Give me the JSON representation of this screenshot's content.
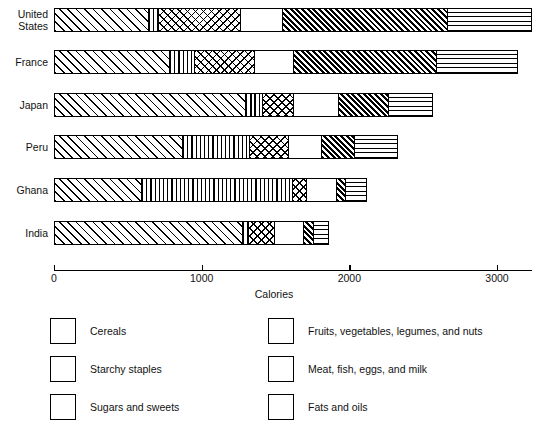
{
  "chart_data": {
    "type": "bar",
    "orientation": "horizontal",
    "stacked": true,
    "title": "",
    "xlabel": "Calories",
    "ylabel": "",
    "xlim": [
      0,
      3300
    ],
    "xticks": [
      0,
      1000,
      2000,
      3000
    ],
    "xtick_labels": [
      "0",
      "1000",
      "2000",
      "3000"
    ],
    "grid": false,
    "legend_position": "bottom",
    "categories": [
      "United States",
      "France",
      "Japan",
      "Peru",
      "Ghana",
      "India"
    ],
    "series": [
      {
        "name": "Cereals",
        "values": [
          640,
          780,
          1300,
          875,
          590,
          1285
        ]
      },
      {
        "name": "Starchy staples",
        "values": [
          70,
          175,
          115,
          455,
          1030,
          40
        ]
      },
      {
        "name": "Sugars and sweets",
        "values": [
          555,
          405,
          215,
          265,
          95,
          175
        ]
      },
      {
        "name": "Fruits, vegetables, legumes, and nuts",
        "values": [
          285,
          265,
          305,
          225,
          210,
          195
        ]
      },
      {
        "name": "Meat, fish, eggs, and milk",
        "values": [
          1125,
          970,
          340,
          225,
          60,
          75
        ]
      },
      {
        "name": "Fats and oils",
        "values": [
          565,
          550,
          290,
          285,
          135,
          95
        ]
      }
    ],
    "totals": [
      3240,
      3145,
      2565,
      2330,
      2120,
      1865
    ]
  },
  "axis": {
    "title": "Calories",
    "ticks": [
      "0",
      "1000",
      "2000",
      "3000"
    ]
  },
  "categories": [
    {
      "label": "United\nStates"
    },
    {
      "label": "France"
    },
    {
      "label": "Japan"
    },
    {
      "label": "Peru"
    },
    {
      "label": "Ghana"
    },
    {
      "label": "India"
    }
  ],
  "legend": {
    "items": [
      {
        "label": "Cereals",
        "pattern": "diagonal-hatch-sparse"
      },
      {
        "label": "Starchy staples",
        "pattern": "vertical-lines"
      },
      {
        "label": "Sugars and sweets",
        "pattern": "cross-hatch"
      },
      {
        "label": "Fruits, vegetables, legumes, and nuts",
        "pattern": "blank"
      },
      {
        "label": "Meat, fish, eggs, and milk",
        "pattern": "diagonal-hatch-dense"
      },
      {
        "label": "Fats and oils",
        "pattern": "horizontal-lines"
      }
    ]
  },
  "colors": {
    "ink": "#000000",
    "background": "#ffffff"
  }
}
